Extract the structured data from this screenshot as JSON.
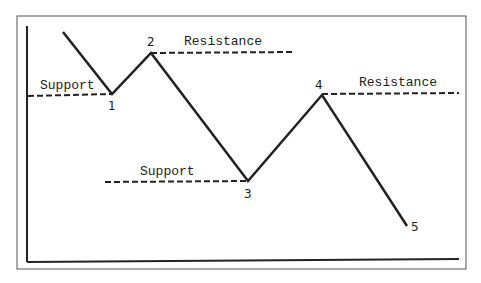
{
  "diagram": {
    "type": "support-resistance",
    "colors": {
      "line": "#222222",
      "frame": "#555555",
      "background": "#ffffff"
    },
    "labels": {
      "support_1": "Support",
      "resistance_2": "Resistance",
      "support_3": "Support",
      "resistance_4": "Resistance"
    },
    "points": [
      {
        "label": "1"
      },
      {
        "label": "2"
      },
      {
        "label": "3"
      },
      {
        "label": "4"
      },
      {
        "label": "5"
      }
    ]
  }
}
